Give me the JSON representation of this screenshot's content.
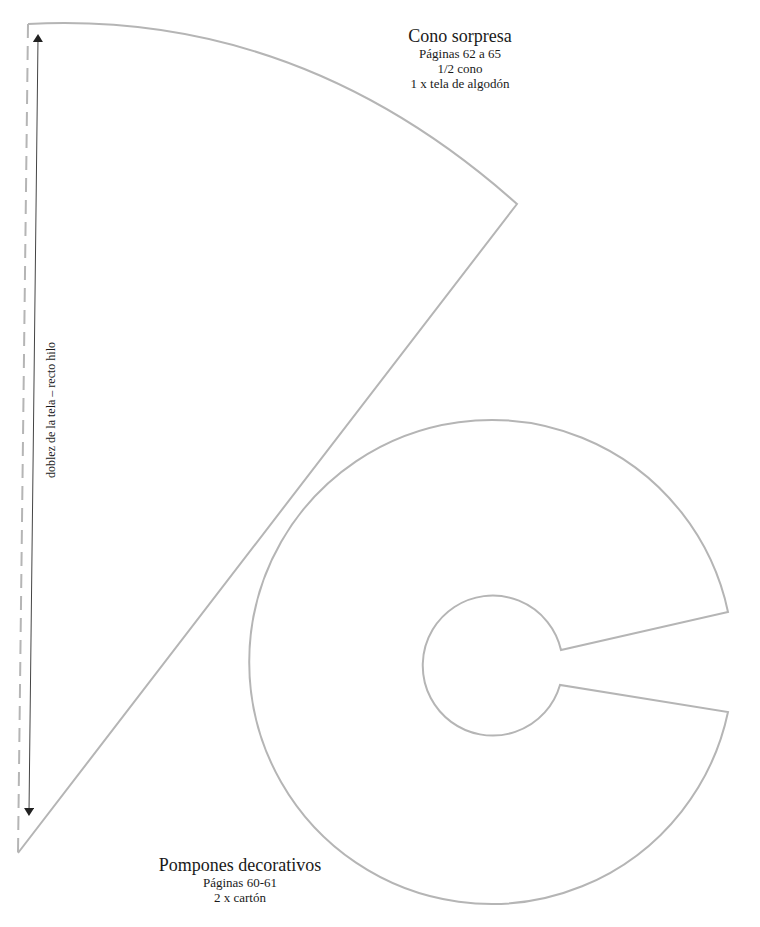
{
  "cone": {
    "title": "Cono sorpresa",
    "pages": "Páginas 62 a 65",
    "portion": "1/2 cono",
    "material": "1 x tela de algodón",
    "fold_label": "doblez de la tela – recto hilo"
  },
  "pompom": {
    "title": "Pompones decorativos",
    "pages": "Páginas 60-61",
    "material": "2 x cartón"
  },
  "colors": {
    "outline": "#b5b5b5",
    "fold_dash": "#b5b5b5",
    "arrow": "#333333",
    "text": "#1a1a1a",
    "background": "#ffffff"
  }
}
